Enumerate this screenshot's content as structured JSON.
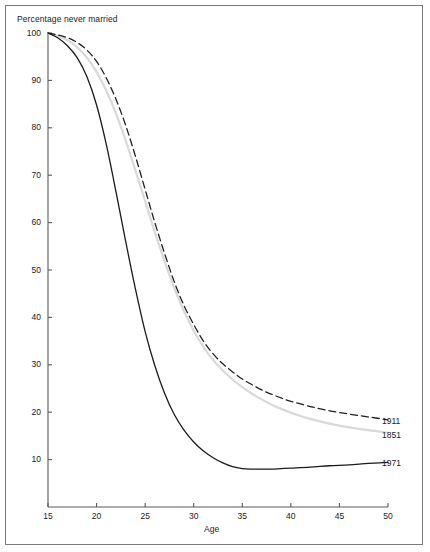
{
  "chart_data": {
    "type": "line",
    "title": "",
    "xlabel": "Age",
    "ylabel": "Percentage never married",
    "xlim": [
      15,
      50
    ],
    "ylim": [
      0,
      100
    ],
    "xticks": [
      15,
      20,
      25,
      30,
      35,
      40,
      45,
      50
    ],
    "yticks": [
      10,
      20,
      30,
      40,
      50,
      60,
      70,
      80,
      90,
      100
    ],
    "grid": false,
    "legend_position": "right-inline-end-of-line",
    "x": [
      15,
      16,
      17,
      18,
      19,
      20,
      21,
      22,
      23,
      24,
      25,
      26,
      27,
      28,
      29,
      30,
      31,
      32,
      33,
      34,
      35,
      36,
      37,
      38,
      39,
      40,
      42,
      44,
      46,
      48,
      50
    ],
    "series": [
      {
        "name": "1911",
        "style": "dashed",
        "color": "#222222",
        "values": [
          100,
          99.6,
          99.0,
          98.0,
          96.4,
          94.0,
          90.5,
          86.0,
          80.5,
          74.0,
          67.0,
          60.0,
          53.5,
          47.5,
          42.5,
          38.5,
          35.0,
          32.3,
          30.2,
          28.5,
          27.0,
          25.8,
          24.7,
          23.8,
          23.0,
          22.3,
          21.2,
          20.3,
          19.6,
          19.0,
          18.4
        ]
      },
      {
        "name": "1851",
        "style": "solid",
        "color": "#d9d9d9",
        "values": [
          100,
          99.4,
          98.5,
          97.0,
          94.8,
          91.8,
          87.8,
          83.0,
          77.3,
          71.0,
          64.5,
          58.0,
          51.8,
          46.2,
          41.3,
          37.2,
          33.8,
          31.0,
          28.8,
          26.9,
          25.3,
          23.9,
          22.7,
          21.6,
          20.7,
          19.9,
          18.6,
          17.6,
          16.8,
          16.2,
          15.7
        ]
      },
      {
        "name": "1971",
        "style": "solid",
        "color": "#1b1b1b",
        "values": [
          100,
          99.0,
          97.3,
          94.8,
          90.8,
          84.8,
          76.5,
          66.5,
          56.0,
          46.0,
          37.0,
          29.8,
          24.0,
          19.5,
          16.2,
          13.7,
          11.8,
          10.4,
          9.3,
          8.5,
          8.1,
          8.0,
          8.0,
          8.0,
          8.1,
          8.2,
          8.4,
          8.7,
          8.9,
          9.2,
          9.4
        ]
      }
    ],
    "annotations": [
      {
        "text": "1911",
        "x_px": 382,
        "y_px": 416
      },
      {
        "text": "1851",
        "x_px": 382,
        "y_px": 430
      },
      {
        "text": "1971",
        "x_px": 382,
        "y_px": 458
      }
    ]
  },
  "axes": {
    "y_title": "Percentage never married",
    "x_title": "Age",
    "y_tick_labels": [
      "100",
      "90",
      "80",
      "70",
      "60",
      "50",
      "40",
      "30",
      "20",
      "10"
    ],
    "x_tick_labels": [
      "15",
      "20",
      "25",
      "30",
      "35",
      "40",
      "45",
      "50"
    ]
  },
  "legend": {
    "items": [
      {
        "label": "1911"
      },
      {
        "label": "1851"
      },
      {
        "label": "1971"
      }
    ]
  },
  "colors": {
    "axis": "#5a5a5a",
    "frame": "#7b7b7b",
    "text": "#1b1b1b",
    "series_1911": "#222222",
    "series_1851": "#d9d9d9",
    "series_1971": "#1b1b1b",
    "background": "#ffffff"
  }
}
